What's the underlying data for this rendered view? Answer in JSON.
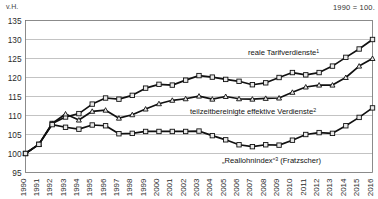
{
  "figure": {
    "unit_label": "v.H.",
    "base_label": "1990 = 100."
  },
  "chart_data": {
    "type": "line",
    "title": "",
    "subtitle": "",
    "xlabel": "",
    "ylabel": "v.H.",
    "ylim": [
      95,
      135
    ],
    "ytick_step": 5,
    "yticks": [
      135,
      130,
      125,
      120,
      115,
      110,
      105,
      100,
      95
    ],
    "grid": "horizontal",
    "legend_position": "inline-annotations",
    "annotation_note": "1990 = 100.",
    "x": [
      1990,
      1991,
      1992,
      1993,
      1994,
      1995,
      1996,
      1997,
      1998,
      1999,
      2000,
      2001,
      2002,
      2003,
      2004,
      2005,
      2006,
      2007,
      2008,
      2009,
      2010,
      2011,
      2012,
      2013,
      2014,
      2015,
      2016
    ],
    "categories": [
      "1990",
      "1991",
      "1992",
      "1993",
      "1994",
      "1995",
      "1996",
      "1997",
      "1998",
      "1999",
      "2000",
      "2001",
      "2002",
      "2003",
      "2004",
      "2005",
      "2006",
      "2007",
      "2008",
      "2009",
      "2010",
      "2011",
      "2012",
      "2013",
      "2014",
      "2015",
      "2016"
    ],
    "series": [
      {
        "name": "reale Tarifverdienste",
        "footnote": "1",
        "label": "reale Tarifverdienste",
        "marker": "square",
        "values": [
          100.0,
          102.4,
          107.9,
          109.6,
          110.5,
          113.0,
          114.6,
          114.3,
          115.3,
          117.2,
          118.2,
          118.0,
          119.3,
          120.5,
          120.1,
          119.5,
          119.0,
          118.1,
          118.6,
          120.0,
          121.3,
          120.7,
          121.3,
          123.0,
          125.3,
          127.5,
          130.0
        ]
      },
      {
        "name": "teilzeitbereinigte effektive Verdienste",
        "footnote": "2",
        "label": "teilzeitbereinigte effektive Verdienste",
        "marker": "triangle",
        "values": [
          100.0,
          102.4,
          107.9,
          110.4,
          108.8,
          111.1,
          111.4,
          109.3,
          110.2,
          111.7,
          113.1,
          114.0,
          114.4,
          115.1,
          114.3,
          115.0,
          114.4,
          114.3,
          114.5,
          114.6,
          116.1,
          117.5,
          118.0,
          118.0,
          120.0,
          123.0,
          125.0
        ]
      },
      {
        "name": "„Reallohnindex“ (Fratzscher)",
        "footnote": "3",
        "label": "„Reallohnindex“",
        "label_suffix": "(Fratzscher)",
        "marker": "square",
        "values": [
          100.0,
          102.4,
          107.6,
          106.9,
          106.4,
          107.5,
          107.3,
          105.2,
          105.3,
          105.8,
          105.8,
          105.8,
          105.8,
          105.9,
          104.7,
          103.6,
          102.3,
          101.8,
          102.3,
          102.2,
          103.5,
          105.0,
          105.5,
          105.3,
          107.3,
          109.5,
          112.0
        ]
      }
    ],
    "series_annotations": [
      {
        "text": "reale Tarifverdienste",
        "sup": "1",
        "x": 248,
        "y": 55
      },
      {
        "text": "teilzeitbereinigte effektive Verdienste",
        "sup": "2",
        "x": 190,
        "y": 114
      },
      {
        "text": "„Reallohnindex“",
        "sup": "3",
        "suffix": " (Fratzscher)",
        "x": 222,
        "y": 163
      }
    ]
  },
  "colors": {
    "line": "#111111",
    "marker_fill": "#e9e9e9",
    "grid": "#9a9a9a",
    "frame": "#6f6f6f",
    "text": "#1a1a1a",
    "background": "#ffffff"
  }
}
